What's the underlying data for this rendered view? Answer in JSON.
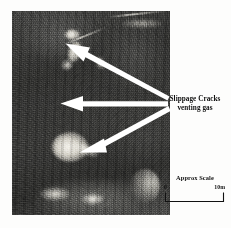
{
  "figure": {
    "type": "annotated-photograph",
    "photo_alt": "slippage-cracks-photo"
  },
  "annotations": {
    "callout": {
      "line1": "Slippage Cracks",
      "line2": "venting gas",
      "arrow_count": 3,
      "arrow_color": "#ffffff",
      "arrows": [
        {
          "name": "arrow-upper",
          "target": "upper bright crack patch"
        },
        {
          "name": "arrow-middle",
          "target": "middle crack trace"
        },
        {
          "name": "arrow-lower",
          "target": "lower bright venting gas plume"
        }
      ]
    }
  },
  "scale": {
    "title": "Approx Scale",
    "start_label": "0",
    "end_label": "10m",
    "units": "m",
    "length": 10
  },
  "colors": {
    "background": "#ffffff",
    "text": "#111111",
    "annotation": "#ffffff",
    "photo_dark": "#2f2f2d",
    "photo_light": "#f2f0ea"
  }
}
